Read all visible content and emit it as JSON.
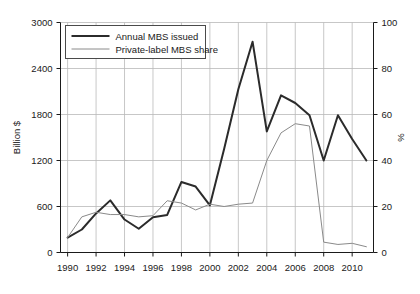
{
  "chart_data": {
    "type": "line",
    "title": "",
    "xlabel": "",
    "ylabel": "Billion $",
    "y2label": "%",
    "x": [
      1990,
      1991,
      1992,
      1993,
      1994,
      1995,
      1996,
      1997,
      1998,
      1999,
      2000,
      2001,
      2002,
      2003,
      2004,
      2005,
      2006,
      2007,
      2008,
      2009,
      2010,
      2011
    ],
    "xlim": [
      1989.5,
      2011.5
    ],
    "ylim": [
      0,
      3000
    ],
    "y2lim": [
      0,
      100
    ],
    "xticks": [
      1990,
      1992,
      1994,
      1996,
      1998,
      2000,
      2002,
      2004,
      2006,
      2008,
      2010
    ],
    "xtick_labels": [
      "1990",
      "1992",
      "1994",
      "1996",
      "1998",
      "2000",
      "2002",
      "2004",
      "2006",
      "2008",
      "2010"
    ],
    "yticks": [
      0,
      600,
      1200,
      1800,
      2400,
      3000
    ],
    "ytick_labels": [
      "0",
      "600",
      "1200",
      "1800",
      "2400",
      "3000"
    ],
    "y2ticks": [
      0,
      20,
      40,
      60,
      80,
      100
    ],
    "y2tick_labels": [
      "0",
      "20",
      "40",
      "60",
      "80",
      "100"
    ],
    "grid": true,
    "legend_position": "top-left",
    "series": [
      {
        "name": "Annual MBS issued",
        "axis": "left",
        "units": "Billion $",
        "color": "#2b2b2b",
        "width": 2.0,
        "values": [
          195,
          300,
          510,
          680,
          430,
          310,
          460,
          490,
          920,
          860,
          615,
          1350,
          2130,
          2750,
          1580,
          2050,
          1950,
          1790,
          1200,
          1790,
          1480,
          1200
        ]
      },
      {
        "name": "Private-label MBS share",
        "axis": "right",
        "units": "%",
        "color": "#8a8a8a",
        "width": 1.0,
        "values": [
          6.5,
          15.5,
          17.5,
          16.5,
          16.5,
          15.5,
          16.0,
          22.5,
          21.5,
          18.5,
          21.0,
          20.0,
          21.0,
          21.5,
          40.0,
          52.0,
          56.0,
          55.0,
          4.5,
          3.5,
          4.0,
          2.5
        ]
      }
    ],
    "legend": [
      {
        "label": "Annual MBS issued",
        "color": "#2b2b2b",
        "width": 2.0
      },
      {
        "label": "Private-label MBS share",
        "color": "#8a8a8a",
        "width": 1.0
      }
    ]
  },
  "colors": {
    "background": "#ffffff",
    "axis": "#1a1a1a",
    "grid": "#b9b9b9",
    "series_primary": "#2b2b2b",
    "series_secondary": "#8a8a8a",
    "legend_border": "#4a4a4a"
  }
}
